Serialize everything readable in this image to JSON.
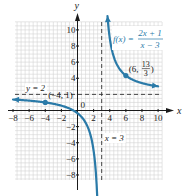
{
  "chart_data": {
    "type": "line",
    "title": "",
    "function": "f(x) = (2x + 1)/(x - 3)",
    "xlabel": "x",
    "ylabel": "y",
    "xlim": [
      -8,
      10
    ],
    "ylim": [
      -8,
      10
    ],
    "grid": true,
    "x_ticks": [
      -8,
      -6,
      -4,
      -2,
      2,
      4,
      6,
      8,
      10
    ],
    "y_ticks": [
      10,
      8,
      6,
      4,
      -2,
      -4,
      -6,
      -8
    ],
    "origin_label": "0",
    "vertical_asymptote": {
      "x": 3,
      "label": "x = 3"
    },
    "horizontal_asymptote": {
      "y": 2,
      "label": "y = 2"
    },
    "series": [
      {
        "name": "f(x) = (2x + 1)/(x - 3), left branch",
        "x_range": [
          -8,
          2.82
        ],
        "arrow_ends": [
          "left",
          "down"
        ]
      },
      {
        "name": "f(x) = (2x + 1)/(x - 3), right branch",
        "x_range": [
          3.72,
          10
        ],
        "arrow_ends": [
          "up",
          "right"
        ]
      }
    ],
    "points": [
      {
        "x": -4,
        "y": 1,
        "label": "(-4, 1)"
      },
      {
        "x": 6,
        "y": 4.3333,
        "label": "(6, 13/3)",
        "label_numerator": "13",
        "label_denominator": "3"
      }
    ],
    "annotations": {
      "function_label": {
        "prefix": "f(x) = ",
        "numerator": "2x + 1",
        "denominator": "x − 3"
      }
    },
    "curve_color": "#2a7aa8",
    "label_color": "#2a7aa8"
  }
}
